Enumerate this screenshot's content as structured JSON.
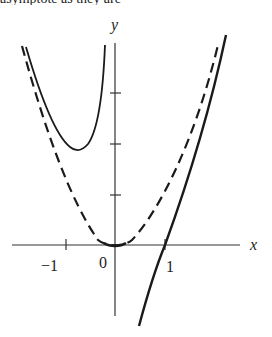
{
  "caption_fragment": "asymptote as they are",
  "axes": {
    "x_label": "x",
    "y_label": "y",
    "x_ticks": [
      {
        "value": -1,
        "label": "−1"
      },
      {
        "value": 0,
        "label": "0"
      },
      {
        "value": 1,
        "label": "1"
      }
    ],
    "y_ticks": [
      1,
      2,
      3
    ]
  },
  "curves": [
    {
      "name": "solid-u-curve",
      "style": "solid",
      "description": "U-shaped curve on left with minimum near (-0.8, 1.9)"
    },
    {
      "name": "dashed-parabola",
      "style": "dashed",
      "description": "parabola-like curve through origin"
    },
    {
      "name": "steep-solid-curve",
      "style": "solid",
      "description": "steep increasing curve crossing x-axis at x=1"
    }
  ],
  "colors": {
    "ink": "#1a1a1a",
    "background": "#ffffff"
  }
}
